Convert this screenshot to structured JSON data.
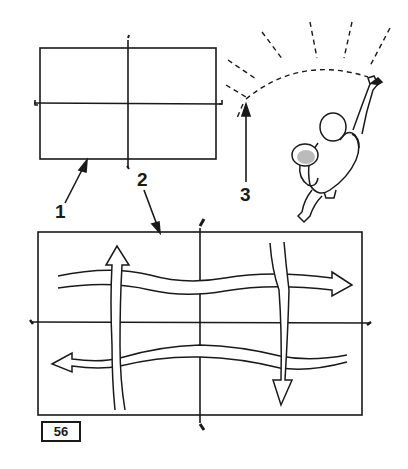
{
  "figure": {
    "number": "56",
    "callouts": [
      {
        "id": 1,
        "label": "1",
        "target": "small table rectangle"
      },
      {
        "id": 2,
        "label": "2",
        "target": "large table rectangle with wavy arrow pattern"
      },
      {
        "id": 3,
        "label": "3",
        "target": "dashed arc swept by arm"
      }
    ],
    "colors": {
      "ink": "#1a1a1a",
      "paper": "#ffffff"
    }
  }
}
